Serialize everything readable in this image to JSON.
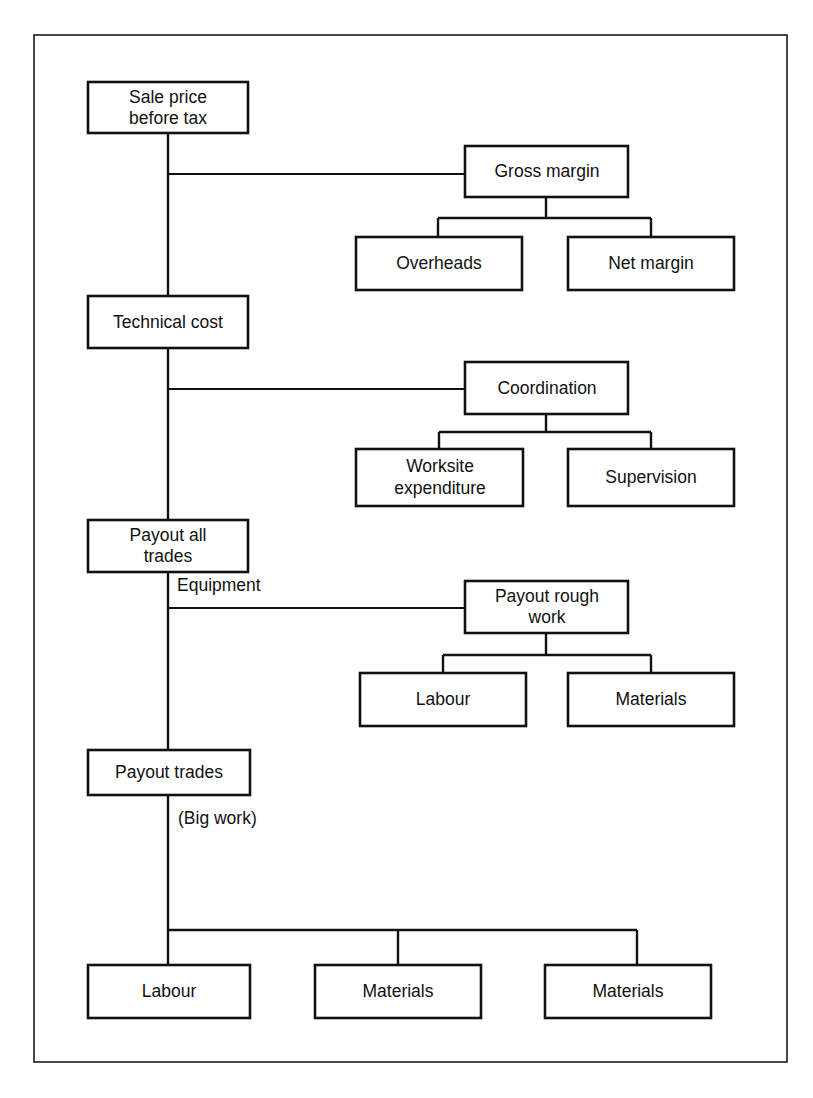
{
  "diagram": {
    "type": "hierarchical-cost-breakdown-tree",
    "title": "",
    "spine_nodes": [
      {
        "id": "sale-price-before-tax",
        "label_lines": [
          "Sale price",
          "before tax"
        ]
      },
      {
        "id": "technical-cost",
        "label_lines": [
          "Technical cost"
        ]
      },
      {
        "id": "payout-all-trades",
        "label_lines": [
          "Payout all",
          "trades"
        ]
      },
      {
        "id": "payout-trades",
        "label_lines": [
          "Payout trades"
        ]
      }
    ],
    "branch_nodes": [
      {
        "id": "gross-margin",
        "label_lines": [
          "Gross margin"
        ]
      },
      {
        "id": "coordination",
        "label_lines": [
          "Coordination"
        ]
      },
      {
        "id": "payout-rough-work",
        "label_lines": [
          "Payout rough",
          "work"
        ]
      }
    ],
    "leaf_nodes": [
      {
        "id": "overheads",
        "label_lines": [
          "Overheads"
        ]
      },
      {
        "id": "net-margin",
        "label_lines": [
          "Net margin"
        ]
      },
      {
        "id": "worksite-expenditure",
        "label_lines": [
          "Worksite",
          "expenditure"
        ]
      },
      {
        "id": "supervision",
        "label_lines": [
          "Supervision"
        ]
      },
      {
        "id": "labour-rough",
        "label_lines": [
          "Labour"
        ]
      },
      {
        "id": "materials-rough",
        "label_lines": [
          "Materials"
        ]
      },
      {
        "id": "labour-big",
        "label_lines": [
          "Labour"
        ]
      },
      {
        "id": "materials-big-1",
        "label_lines": [
          "Materials"
        ]
      },
      {
        "id": "materials-big-2",
        "label_lines": [
          "Materials"
        ]
      }
    ],
    "edge_labels": [
      {
        "id": "equipment",
        "text": "Equipment"
      },
      {
        "id": "big-work",
        "text": "(Big work)"
      }
    ],
    "colors": {
      "box_stroke": "#111111",
      "frame_stroke": "#1a1a1a",
      "background": "#ffffff",
      "text": "#111111"
    }
  }
}
